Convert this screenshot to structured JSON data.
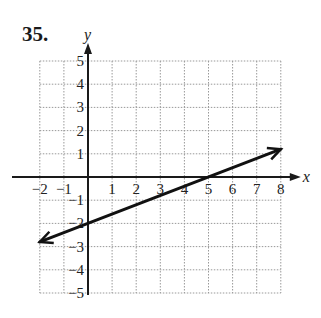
{
  "problem": {
    "number": "35."
  },
  "chart_data": {
    "type": "line",
    "title": "",
    "xlabel": "x",
    "ylabel": "y",
    "xlim": [
      -2,
      8
    ],
    "ylim": [
      -5,
      5
    ],
    "grid": true,
    "x_ticks": [
      "-2",
      "-1",
      "1",
      "2",
      "3",
      "4",
      "5",
      "6",
      "7",
      "8"
    ],
    "y_ticks": [
      "5",
      "4",
      "3",
      "2",
      "1",
      "-1",
      "-2",
      "-3",
      "-4",
      "-5"
    ],
    "series": [
      {
        "name": "line",
        "equation": "y = (2/5)x - 2",
        "x": [
          -2,
          0,
          5,
          8
        ],
        "y": [
          -2.8,
          -2,
          0,
          1.2
        ],
        "arrows": "both"
      }
    ]
  }
}
